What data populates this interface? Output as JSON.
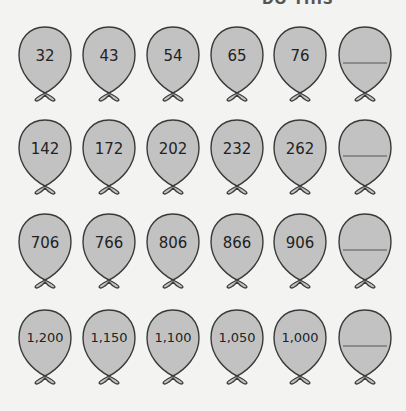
{
  "header": {
    "text": "DO THIS"
  },
  "colors": {
    "balloon_fill": "#c2c2c2",
    "balloon_stroke": "#3a3a3a",
    "background": "#f3f3f1"
  },
  "rows": [
    {
      "values": [
        "32",
        "43",
        "54",
        "65",
        "76",
        ""
      ]
    },
    {
      "values": [
        "142",
        "172",
        "202",
        "232",
        "262",
        ""
      ]
    },
    {
      "values": [
        "706",
        "766",
        "806",
        "866",
        "906",
        ""
      ]
    },
    {
      "values": [
        "1,200",
        "1,150",
        "1,100",
        "1,050",
        "1,000",
        ""
      ]
    }
  ]
}
